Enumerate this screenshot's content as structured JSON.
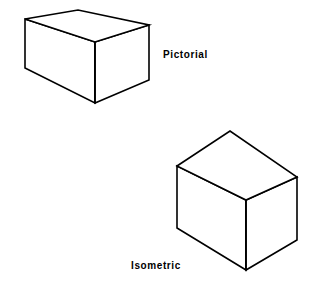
{
  "figure": {
    "background_color": "#ffffff",
    "stroke_color": "#000000",
    "width": 327,
    "height": 285
  },
  "labels": {
    "pictorial": "Pictorial",
    "isometric": "Isometric"
  },
  "shapes": {
    "pictorial_box": {
      "name": "Pictorial",
      "top_face_points": "25,19 78,10 149,25 95,42",
      "left_face_points": "25,19 95,42 95,103 25,68",
      "right_face_points": "95,42 149,25 149,80 95,103",
      "front_vertical_edge": {
        "x1": 95,
        "y1": 42,
        "x2": 95,
        "y2": 103
      },
      "vertices": {
        "top_left": "25,19",
        "top_apex": "78,10",
        "top_right": "149,25",
        "front_top": "95,42",
        "bottom_left": "25,68",
        "front_bottom": "95,103",
        "bottom_right": "149,80"
      }
    },
    "isometric_cube": {
      "name": "Isometric",
      "top_face_points": "177,166 230,131 297,177 246,200",
      "left_face_points": "177,166 246,200 246,270 177,228",
      "right_face_points": "246,200 297,177 297,240 246,270",
      "front_vertical_edge": {
        "x1": 246,
        "y1": 200,
        "x2": 246,
        "y2": 270
      },
      "vertices": {
        "top_left": "177,166",
        "top_apex": "230,131",
        "top_right": "297,177",
        "front_top": "246,200",
        "bottom_left": "177,228",
        "front_bottom": "246,270",
        "bottom_right": "297,240"
      }
    }
  }
}
